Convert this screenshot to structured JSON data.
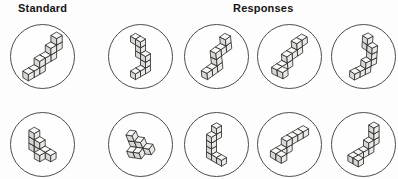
{
  "labels": {
    "standard": "Standard",
    "responses": "Responses"
  },
  "colors": {
    "background": "#fdfdfd",
    "circle_stroke": "#4d4d4d",
    "edge": "#262626",
    "face_top": "#f9f9f7",
    "face_right": "#e9e9e6",
    "face_left": "#d7d7d4",
    "label_text": "#161616"
  },
  "figures": {
    "row1": {
      "standard": {
        "scale": 6.5,
        "rotate": 0,
        "cubes": [
          [
            0,
            2,
            0
          ],
          [
            0,
            1,
            0
          ],
          [
            0,
            0,
            0
          ],
          [
            0,
            0,
            1
          ],
          [
            0,
            -1,
            1
          ],
          [
            0,
            -2,
            1
          ],
          [
            0,
            -2,
            2
          ],
          [
            0,
            -3,
            2
          ],
          [
            0,
            -3,
            3
          ]
        ]
      },
      "responses": [
        {
          "scale": 5.8,
          "rotate": 0,
          "cubes": [
            [
              -1,
              0,
              4
            ],
            [
              0,
              0,
              4
            ],
            [
              0,
              0,
              3
            ],
            [
              0,
              0,
              2
            ],
            [
              1,
              0,
              2
            ],
            [
              1,
              0,
              1
            ],
            [
              1,
              0,
              0
            ],
            [
              1,
              1,
              0
            ],
            [
              1,
              2,
              0
            ]
          ]
        },
        {
          "scale": 6.3,
          "rotate": -6,
          "cubes": [
            [
              0,
              2,
              0
            ],
            [
              0,
              1,
              0
            ],
            [
              0,
              0,
              0
            ],
            [
              0,
              0,
              1
            ],
            [
              0,
              0,
              2
            ],
            [
              0,
              -1,
              2
            ],
            [
              0,
              -2,
              2
            ],
            [
              0,
              -2,
              3
            ]
          ]
        },
        {
          "scale": 6.2,
          "rotate": -4,
          "cubes": [
            [
              1,
              2,
              0
            ],
            [
              0,
              2,
              0
            ],
            [
              0,
              1,
              0
            ],
            [
              0,
              0,
              0
            ],
            [
              0,
              0,
              1
            ],
            [
              0,
              -1,
              1
            ],
            [
              0,
              -2,
              1
            ],
            [
              0,
              -2,
              2
            ],
            [
              0,
              -3,
              2
            ]
          ]
        },
        {
          "scale": 6.0,
          "rotate": 4,
          "cubes": [
            [
              0,
              2,
              0
            ],
            [
              0,
              1,
              0
            ],
            [
              0,
              0,
              0
            ],
            [
              0,
              0,
              1
            ],
            [
              0,
              -1,
              1
            ],
            [
              0,
              -1,
              2
            ],
            [
              0,
              -1,
              3
            ],
            [
              -1,
              -1,
              3
            ],
            [
              -1,
              -1,
              4
            ]
          ]
        }
      ]
    },
    "row2": {
      "standard": {
        "scale": 6.3,
        "rotate": 0,
        "cubes": [
          [
            0,
            0,
            2
          ],
          [
            0,
            0,
            1
          ],
          [
            0,
            0,
            0
          ],
          [
            1,
            0,
            1
          ],
          [
            1,
            0,
            0
          ],
          [
            2,
            0,
            0
          ],
          [
            3,
            0,
            0
          ],
          [
            2,
            1,
            0
          ]
        ]
      },
      "responses": [
        {
          "scale": 6.2,
          "rotate": -22,
          "cubes": [
            [
              0,
              0,
              2
            ],
            [
              0,
              0,
              1
            ],
            [
              0,
              0,
              0
            ],
            [
              1,
              0,
              1
            ],
            [
              1,
              0,
              0
            ],
            [
              2,
              0,
              0
            ],
            [
              0,
              1,
              0
            ],
            [
              1,
              1,
              0
            ]
          ]
        },
        {
          "scale": 5.8,
          "rotate": 0,
          "cubes": [
            [
              0,
              -1,
              4
            ],
            [
              0,
              -1,
              3
            ],
            [
              0,
              0,
              3
            ],
            [
              0,
              0,
              2
            ],
            [
              0,
              0,
              1
            ],
            [
              0,
              0,
              0
            ],
            [
              1,
              0,
              0
            ],
            [
              2,
              0,
              0
            ]
          ]
        },
        {
          "scale": 6.3,
          "rotate": 0,
          "cubes": [
            [
              1,
              2,
              0
            ],
            [
              0,
              2,
              0
            ],
            [
              0,
              1,
              0
            ],
            [
              0,
              0,
              0
            ],
            [
              0,
              0,
              1
            ],
            [
              0,
              -1,
              1
            ],
            [
              0,
              -2,
              1
            ],
            [
              0,
              -3,
              1
            ]
          ]
        },
        {
          "scale": 6.0,
          "rotate": 0,
          "cubes": [
            [
              1,
              2,
              0
            ],
            [
              0,
              2,
              0
            ],
            [
              0,
              1,
              0
            ],
            [
              0,
              0,
              0
            ],
            [
              0,
              -1,
              0
            ],
            [
              0,
              -1,
              1
            ],
            [
              0,
              -2,
              1
            ],
            [
              0,
              -2,
              2
            ],
            [
              0,
              -2,
              3
            ]
          ]
        }
      ]
    }
  }
}
